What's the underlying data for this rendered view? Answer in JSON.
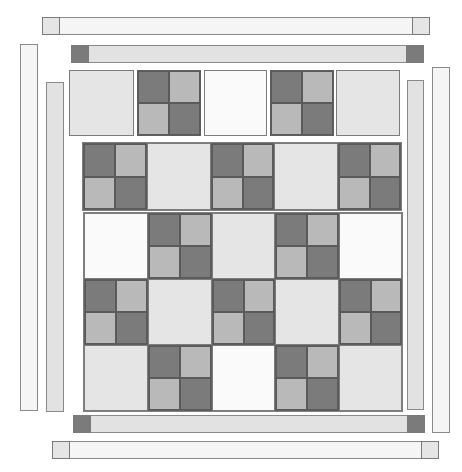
{
  "colors": {
    "dark": "#7b7b7b",
    "medium": "#b9b9b9",
    "light": "#e5e5e5",
    "white": "#fafafa",
    "strip_outer": "#f5f5f5",
    "strip_inner": "#e2e2e2",
    "outline": "#808080"
  },
  "borders": {
    "outer_top": {
      "x": 42,
      "y": 17,
      "w": 388,
      "h": 18,
      "fill": "strip_outer",
      "caps": [
        {
          "side": "left",
          "fill": "light"
        },
        {
          "side": "right",
          "fill": "light"
        }
      ]
    },
    "inner_top": {
      "x": 71,
      "y": 45,
      "w": 353,
      "h": 18,
      "fill": "strip_inner",
      "caps": [
        {
          "side": "left",
          "fill": "dark"
        },
        {
          "side": "right",
          "fill": "dark"
        }
      ]
    },
    "outer_left": {
      "x": 20,
      "y": 44,
      "w": 18,
      "h": 367,
      "fill": "strip_outer"
    },
    "inner_left": {
      "x": 46,
      "y": 82,
      "w": 18,
      "h": 330,
      "fill": "strip_inner"
    },
    "inner_right": {
      "x": 407,
      "y": 80,
      "w": 17,
      "h": 330,
      "fill": "strip_inner"
    },
    "outer_right": {
      "x": 432,
      "y": 67,
      "w": 18,
      "h": 366,
      "fill": "strip_outer"
    },
    "inner_bottom": {
      "x": 73,
      "y": 415,
      "w": 352,
      "h": 18,
      "fill": "strip_inner",
      "caps": [
        {
          "side": "left",
          "fill": "dark"
        },
        {
          "side": "right",
          "fill": "dark"
        }
      ]
    },
    "outer_bottom": {
      "x": 52,
      "y": 441,
      "w": 387,
      "h": 18,
      "fill": "strip_outer",
      "caps": [
        {
          "side": "left",
          "fill": "light"
        },
        {
          "side": "right",
          "fill": "light"
        }
      ]
    }
  },
  "rows": [
    {
      "name": "row-1-separate",
      "y": 70,
      "h": 66,
      "separate": true,
      "cells": [
        {
          "x": 69,
          "w": 65,
          "type": "light"
        },
        {
          "x": 137,
          "w": 64,
          "type": "four-patch"
        },
        {
          "x": 204,
          "w": 63,
          "type": "white"
        },
        {
          "x": 270,
          "w": 64,
          "type": "four-patch"
        },
        {
          "x": 336,
          "w": 64,
          "type": "light"
        }
      ]
    },
    {
      "name": "row-2",
      "y": 143,
      "h": 67,
      "separate": false,
      "frame": {
        "x": 83,
        "w": 318
      },
      "cells": [
        {
          "x": 83,
          "w": 64,
          "type": "four-patch"
        },
        {
          "x": 147,
          "w": 64,
          "type": "light"
        },
        {
          "x": 211,
          "w": 63,
          "type": "four-patch"
        },
        {
          "x": 274,
          "w": 64,
          "type": "light"
        },
        {
          "x": 338,
          "w": 63,
          "type": "four-patch"
        }
      ]
    },
    {
      "name": "row-3",
      "y": 213,
      "h": 66,
      "separate": false,
      "group": "lower",
      "cells": [
        {
          "x": 84,
          "w": 64,
          "type": "white"
        },
        {
          "x": 148,
          "w": 64,
          "type": "four-patch"
        },
        {
          "x": 212,
          "w": 63,
          "type": "light"
        },
        {
          "x": 275,
          "w": 64,
          "type": "four-patch"
        },
        {
          "x": 339,
          "w": 63,
          "type": "white"
        }
      ]
    },
    {
      "name": "row-4",
      "y": 279,
      "h": 66,
      "separate": false,
      "group": "lower",
      "cells": [
        {
          "x": 84,
          "w": 64,
          "type": "four-patch"
        },
        {
          "x": 148,
          "w": 64,
          "type": "light"
        },
        {
          "x": 212,
          "w": 63,
          "type": "four-patch"
        },
        {
          "x": 275,
          "w": 64,
          "type": "light"
        },
        {
          "x": 339,
          "w": 63,
          "type": "four-patch"
        }
      ]
    },
    {
      "name": "row-5",
      "y": 345,
      "h": 66,
      "separate": false,
      "group": "lower",
      "cells": [
        {
          "x": 84,
          "w": 64,
          "type": "light"
        },
        {
          "x": 148,
          "w": 64,
          "type": "four-patch"
        },
        {
          "x": 212,
          "w": 63,
          "type": "white"
        },
        {
          "x": 275,
          "w": 64,
          "type": "four-patch"
        },
        {
          "x": 339,
          "w": 63,
          "type": "light"
        }
      ]
    }
  ],
  "lower_frame": {
    "x": 84,
    "y": 213,
    "w": 318,
    "h": 198
  },
  "four_patch_pattern": [
    "dark",
    "medium",
    "medium",
    "dark"
  ]
}
